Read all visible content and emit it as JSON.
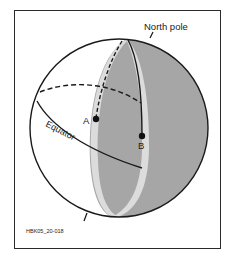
{
  "diagram": {
    "labels": {
      "north_pole": "North pole",
      "equator": "Equator",
      "point_a": "A",
      "point_b": "B",
      "figure_id": "HBK05_20-018"
    },
    "colors": {
      "shaded_hemisphere": "#a6a6a6",
      "band": "#dcdcdc",
      "outline": "#1a1a1a",
      "background": "#ffffff"
    }
  }
}
